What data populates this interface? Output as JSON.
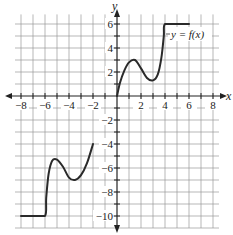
{
  "chart_data": {
    "type": "line",
    "title": "",
    "xlabel": "x",
    "ylabel": "y",
    "xlim": [
      -8.5,
      8.5
    ],
    "ylim": [
      -11,
      6.8
    ],
    "grid": true,
    "grid_step": 1,
    "x_ticks": [
      -8,
      -6,
      -4,
      -2,
      2,
      4,
      6,
      8
    ],
    "x_tick_labels": [
      "−8",
      "−6",
      "−4",
      "−2",
      "2",
      "4",
      "6",
      "8"
    ],
    "y_ticks": [
      6,
      4,
      2,
      -2,
      -4,
      -6,
      -8,
      -10
    ],
    "y_tick_labels": [
      "6",
      "4",
      "2",
      "−2",
      "−4",
      "−6",
      "−8",
      "−10"
    ],
    "annotation": "y = f(x)",
    "series": [
      {
        "name": "f(x) right piece",
        "x": [
          0,
          0.25,
          0.6,
          1.0,
          1.5,
          2.0,
          2.5,
          3.0,
          3.4,
          3.7,
          3.9,
          4.0,
          5.0,
          6.0
        ],
        "y": [
          0,
          1.1,
          2.1,
          2.8,
          3.0,
          2.3,
          1.5,
          1.3,
          1.8,
          3.2,
          5.0,
          6.0,
          6.0,
          6.0
        ]
      },
      {
        "name": "f(x) left piece",
        "x": [
          -8,
          -7,
          -6,
          -5.9,
          -5.7,
          -5.4,
          -5.0,
          -4.5,
          -4.0,
          -3.5,
          -3.0,
          -2.5,
          -2.0
        ],
        "y": [
          -10,
          -10,
          -10,
          -8.5,
          -6.5,
          -5.4,
          -5.3,
          -5.9,
          -6.8,
          -7.0,
          -6.6,
          -5.6,
          -4.0
        ]
      }
    ]
  },
  "axes": {
    "x_label": "x",
    "y_label": "y"
  },
  "labels": {
    "function": "y = f(x)"
  }
}
